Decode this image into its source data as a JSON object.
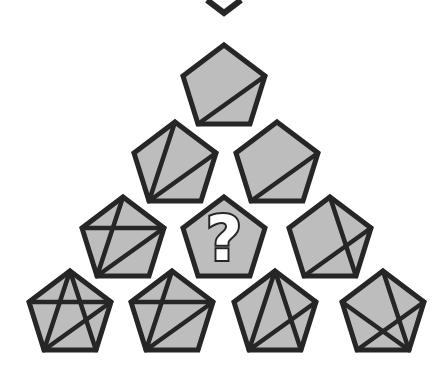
{
  "puzzle": {
    "title": "Pentagon diagonal pyramid puzzle",
    "question_mark": "?",
    "colors": {
      "fill": "#bdbdbd",
      "stroke": "#262626",
      "background": "#ffffff"
    },
    "vertex_names": [
      "top",
      "right",
      "bottom-right",
      "bottom-left",
      "left"
    ],
    "rows": [
      [
        {
          "cx": 224,
          "cy": 86,
          "lines": [
            [
              "right",
              "bottom-left"
            ]
          ]
        }
      ],
      [
        {
          "cx": 175,
          "cy": 163,
          "lines": [
            [
              "top",
              "bottom-left"
            ],
            [
              "right",
              "bottom-left"
            ]
          ]
        },
        {
          "cx": 277,
          "cy": 163,
          "lines": [
            [
              "right",
              "bottom-left"
            ]
          ]
        }
      ],
      [
        {
          "cx": 123,
          "cy": 238,
          "lines": [
            [
              "top",
              "bottom-left"
            ],
            [
              "right",
              "bottom-left"
            ],
            [
              "left",
              "right"
            ]
          ]
        },
        {
          "cx": 224,
          "cy": 238,
          "unknown": true,
          "lines": []
        },
        {
          "cx": 330,
          "cy": 238,
          "lines": [
            [
              "top",
              "bottom-right"
            ],
            [
              "right",
              "bottom-left"
            ]
          ]
        }
      ],
      [
        {
          "cx": 70,
          "cy": 312,
          "lines": [
            [
              "top",
              "bottom-left"
            ],
            [
              "top",
              "bottom-right"
            ],
            [
              "left",
              "right"
            ],
            [
              "right",
              "bottom-left"
            ]
          ]
        },
        {
          "cx": 172,
          "cy": 312,
          "lines": [
            [
              "top",
              "bottom-left"
            ],
            [
              "left",
              "right"
            ],
            [
              "right",
              "bottom-left"
            ]
          ]
        },
        {
          "cx": 275,
          "cy": 312,
          "lines": [
            [
              "top",
              "bottom-left"
            ],
            [
              "top",
              "bottom-right"
            ],
            [
              "right",
              "bottom-left"
            ]
          ]
        },
        {
          "cx": 383,
          "cy": 312,
          "lines": [
            [
              "top",
              "bottom-right"
            ],
            [
              "left",
              "bottom-right"
            ],
            [
              "right",
              "bottom-left"
            ]
          ]
        }
      ]
    ],
    "top_chevron": {
      "points": [
        [
          207,
          0
        ],
        [
          224,
          13
        ],
        [
          241,
          0
        ]
      ]
    }
  }
}
